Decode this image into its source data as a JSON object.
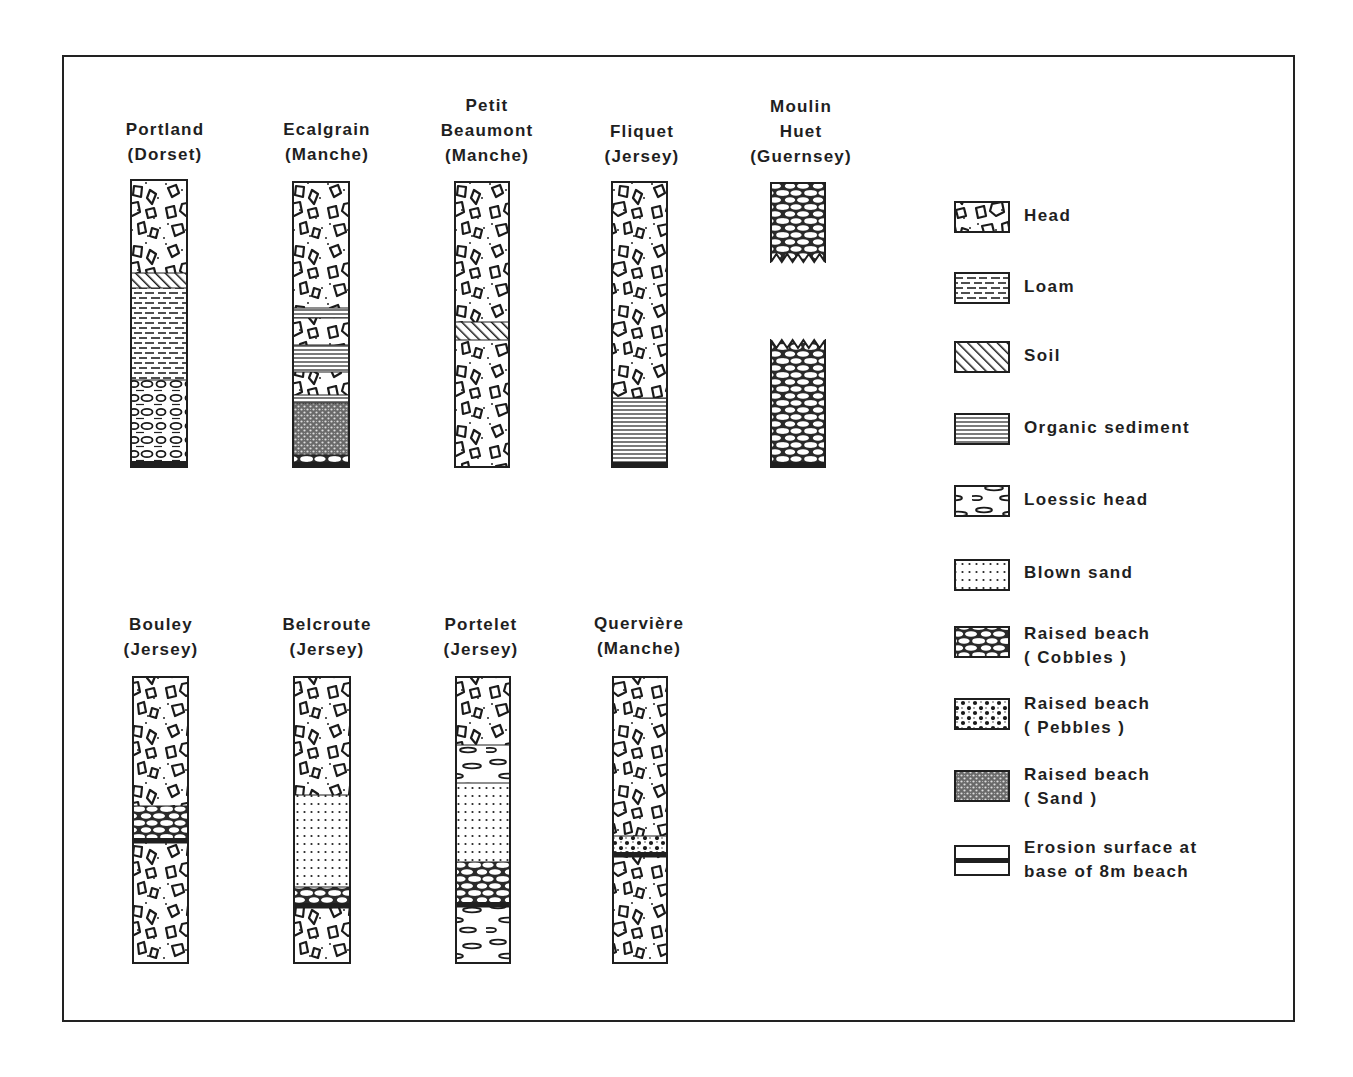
{
  "figure": {
    "type": "stratigraphic-column-diagram",
    "frame": {
      "x": 62,
      "y": 55,
      "w": 1233,
      "h": 967
    }
  },
  "legend": {
    "items": [
      {
        "key": "head",
        "label": "Head",
        "label2": ""
      },
      {
        "key": "loam",
        "label": "Loam",
        "label2": ""
      },
      {
        "key": "soil",
        "label": "Soil",
        "label2": ""
      },
      {
        "key": "organic",
        "label": "Organic  sediment",
        "label2": ""
      },
      {
        "key": "loessic",
        "label": "Loessic  head",
        "label2": ""
      },
      {
        "key": "blown",
        "label": "Blown  sand",
        "label2": ""
      },
      {
        "key": "cobbles",
        "label": "Raised  beach",
        "label2": "( Cobbles )"
      },
      {
        "key": "pebbles",
        "label": "Raised  beach",
        "label2": "( Pebbles )"
      },
      {
        "key": "sand",
        "label": "Raised  beach",
        "label2": "( Sand )"
      },
      {
        "key": "erosion",
        "label": "Erosion  surface  at",
        "label2": "base  of  8m  beach"
      }
    ]
  },
  "columns": [
    {
      "name": "Portland",
      "line2": "",
      "region": "(Dorset)",
      "x": 131,
      "w": 56,
      "top": 180,
      "bottom": 467,
      "layers": [
        {
          "type": "head",
          "from": 180,
          "to": 273
        },
        {
          "type": "soil",
          "from": 273,
          "to": 288
        },
        {
          "type": "loam",
          "from": 288,
          "to": 380
        },
        {
          "type": "loessic",
          "from": 380,
          "to": 461
        },
        {
          "type": "erosion",
          "from": 461,
          "to": 467
        }
      ]
    },
    {
      "name": "Ecalgrain",
      "line2": "",
      "region": "(Manche)",
      "x": 293,
      "w": 56,
      "top": 182,
      "bottom": 467,
      "layers": [
        {
          "type": "head",
          "from": 182,
          "to": 308
        },
        {
          "type": "organic",
          "from": 308,
          "to": 318
        },
        {
          "type": "head",
          "from": 318,
          "to": 345
        },
        {
          "type": "organic",
          "from": 345,
          "to": 372
        },
        {
          "type": "head",
          "from": 372,
          "to": 395
        },
        {
          "type": "organic",
          "from": 395,
          "to": 403
        },
        {
          "type": "sand",
          "from": 403,
          "to": 455
        },
        {
          "type": "cobbles",
          "from": 455,
          "to": 462
        },
        {
          "type": "erosion",
          "from": 462,
          "to": 467
        }
      ]
    },
    {
      "name": "Petit",
      "line2": "Beaumont",
      "region": "(Manche)",
      "x": 455,
      "w": 54,
      "top": 182,
      "bottom": 467,
      "layers": [
        {
          "type": "head",
          "from": 182,
          "to": 322
        },
        {
          "type": "soil",
          "from": 322,
          "to": 340
        },
        {
          "type": "head",
          "from": 340,
          "to": 467
        }
      ]
    },
    {
      "name": "Fliquet",
      "line2": "",
      "region": "(Jersey)",
      "x": 612,
      "w": 55,
      "top": 182,
      "bottom": 467,
      "layers": [
        {
          "type": "head",
          "from": 182,
          "to": 398
        },
        {
          "type": "organic",
          "from": 398,
          "to": 462
        },
        {
          "type": "erosion",
          "from": 462,
          "to": 467
        }
      ]
    },
    {
      "name": "Moulin",
      "line2": "Huet",
      "region": "(Guernsey)",
      "x": 771,
      "w": 54,
      "top": 183,
      "bottom": 467,
      "broken": true,
      "layers": [
        {
          "type": "cobbles",
          "from": 183,
          "to": 262
        },
        {
          "type": "cobbles",
          "from": 340,
          "to": 462
        },
        {
          "type": "erosion",
          "from": 462,
          "to": 467
        }
      ]
    },
    {
      "name": "Bouley",
      "line2": "",
      "region": "(Jersey)",
      "x": 133,
      "w": 55,
      "top": 677,
      "bottom": 963,
      "layers": [
        {
          "type": "head",
          "from": 677,
          "to": 806
        },
        {
          "type": "cobbles",
          "from": 806,
          "to": 838
        },
        {
          "type": "erosion",
          "from": 838,
          "to": 843
        },
        {
          "type": "head",
          "from": 843,
          "to": 963
        }
      ]
    },
    {
      "name": "Belcroute",
      "line2": "",
      "region": "(Jersey)",
      "x": 294,
      "w": 56,
      "top": 677,
      "bottom": 963,
      "layers": [
        {
          "type": "head",
          "from": 677,
          "to": 795
        },
        {
          "type": "blown",
          "from": 795,
          "to": 887
        },
        {
          "type": "cobbles",
          "from": 887,
          "to": 903
        },
        {
          "type": "erosion",
          "from": 903,
          "to": 908
        },
        {
          "type": "head",
          "from": 908,
          "to": 963
        }
      ]
    },
    {
      "name": "Portelet",
      "line2": "",
      "region": "(Jersey)",
      "x": 456,
      "w": 54,
      "top": 677,
      "bottom": 963,
      "layers": [
        {
          "type": "head",
          "from": 677,
          "to": 745
        },
        {
          "type": "loessic",
          "from": 745,
          "to": 783
        },
        {
          "type": "blown",
          "from": 783,
          "to": 862
        },
        {
          "type": "cobbles",
          "from": 862,
          "to": 902
        },
        {
          "type": "erosion",
          "from": 902,
          "to": 907
        },
        {
          "type": "loessic",
          "from": 907,
          "to": 963
        }
      ]
    },
    {
      "name": "Quervière",
      "line2": "",
      "region": "(Manche)",
      "x": 613,
      "w": 54,
      "top": 677,
      "bottom": 963,
      "layers": [
        {
          "type": "head",
          "from": 677,
          "to": 836
        },
        {
          "type": "pebbles",
          "from": 836,
          "to": 852
        },
        {
          "type": "erosion",
          "from": 852,
          "to": 857
        },
        {
          "type": "head",
          "from": 857,
          "to": 963
        }
      ]
    }
  ],
  "colors": {
    "ink": "#1f1f1f",
    "paper": "#ffffff"
  }
}
